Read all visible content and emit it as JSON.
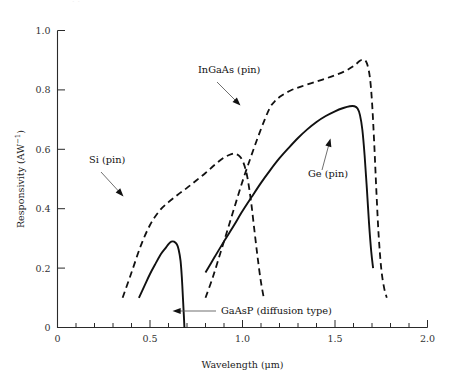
{
  "figure": {
    "ghost_fragment": "··",
    "background": "#ffffff",
    "ink": "#111111"
  },
  "axes": {
    "x": {
      "title": "Wavelength (μm)",
      "min": 0,
      "max": 2.0,
      "major_tick_labels": [
        "0",
        "0.5",
        "1.0",
        "1.5",
        "2.0"
      ],
      "major_tick_values": [
        0,
        0.5,
        1.0,
        1.5,
        2.0
      ],
      "minor_tick_step": 0.1
    },
    "y": {
      "title": "Responsivity (AW",
      "title_sup": "−1",
      "title_tail": ")",
      "min": 0,
      "max": 1.0,
      "major_tick_labels": [
        "0",
        "0.2",
        "0.4",
        "0.6",
        "0.8",
        "1.0"
      ],
      "major_tick_values": [
        0,
        0.2,
        0.4,
        0.6,
        0.8,
        1.0
      ]
    }
  },
  "annotations": [
    {
      "name": "si-pin",
      "text": "Si (pin)",
      "x": 89,
      "y": 163
    },
    {
      "name": "ingaas-pin",
      "text": "InGaAs (pin)",
      "x": 198,
      "y": 73
    },
    {
      "name": "ge-pin",
      "text": "Ge (pin)",
      "x": 308,
      "y": 177
    },
    {
      "name": "gaasp-diffusion",
      "text": "GaAsP (diffusion type)",
      "x": 221,
      "y": 314
    }
  ],
  "chart_data": {
    "type": "line",
    "title": "",
    "xlabel": "Wavelength (μm)",
    "ylabel": "Responsivity (AW-1)",
    "xlim": [
      0,
      2.0
    ],
    "ylim": [
      0,
      1.0
    ],
    "grid": false,
    "legend_position": "inline-annotations",
    "series": [
      {
        "name": "GaAsP (diffusion type)",
        "style": "solid",
        "peak": {
          "x": 0.62,
          "y": 0.29
        },
        "points": [
          [
            0.44,
            0.1
          ],
          [
            0.47,
            0.14
          ],
          [
            0.5,
            0.18
          ],
          [
            0.53,
            0.215
          ],
          [
            0.56,
            0.248
          ],
          [
            0.585,
            0.268
          ],
          [
            0.6,
            0.281
          ],
          [
            0.615,
            0.289
          ],
          [
            0.63,
            0.289
          ],
          [
            0.645,
            0.28
          ],
          [
            0.655,
            0.262
          ],
          [
            0.665,
            0.225
          ],
          [
            0.672,
            0.17
          ],
          [
            0.678,
            0.1
          ],
          [
            0.683,
            0.04
          ],
          [
            0.686,
            0.0
          ]
        ]
      },
      {
        "name": "Si (pin)",
        "style": "dashed",
        "peak": {
          "x": 0.95,
          "y": 0.585
        },
        "points": [
          [
            0.352,
            0.1
          ],
          [
            0.4,
            0.185
          ],
          [
            0.45,
            0.275
          ],
          [
            0.5,
            0.345
          ],
          [
            0.55,
            0.392
          ],
          [
            0.6,
            0.422
          ],
          [
            0.65,
            0.447
          ],
          [
            0.7,
            0.47
          ],
          [
            0.75,
            0.495
          ],
          [
            0.8,
            0.52
          ],
          [
            0.85,
            0.548
          ],
          [
            0.9,
            0.572
          ],
          [
            0.94,
            0.584
          ],
          [
            0.96,
            0.585
          ],
          [
            0.985,
            0.576
          ],
          [
            1.005,
            0.555
          ],
          [
            1.025,
            0.51
          ],
          [
            1.045,
            0.43
          ],
          [
            1.062,
            0.34
          ],
          [
            1.08,
            0.245
          ],
          [
            1.098,
            0.16
          ],
          [
            1.115,
            0.1
          ]
        ]
      },
      {
        "name": "InGaAs (pin)",
        "style": "dashed",
        "peak": {
          "x": 1.65,
          "y": 0.902
        },
        "points": [
          [
            0.8,
            0.1
          ],
          [
            0.84,
            0.17
          ],
          [
            0.88,
            0.25
          ],
          [
            0.92,
            0.33
          ],
          [
            0.96,
            0.412
          ],
          [
            1.0,
            0.492
          ],
          [
            1.04,
            0.565
          ],
          [
            1.08,
            0.635
          ],
          [
            1.12,
            0.7
          ],
          [
            1.15,
            0.742
          ],
          [
            1.175,
            0.762
          ],
          [
            1.21,
            0.78
          ],
          [
            1.26,
            0.798
          ],
          [
            1.32,
            0.812
          ],
          [
            1.4,
            0.828
          ],
          [
            1.48,
            0.845
          ],
          [
            1.55,
            0.862
          ],
          [
            1.6,
            0.88
          ],
          [
            1.635,
            0.898
          ],
          [
            1.655,
            0.902
          ],
          [
            1.672,
            0.89
          ],
          [
            1.688,
            0.845
          ],
          [
            1.7,
            0.76
          ],
          [
            1.712,
            0.62
          ],
          [
            1.724,
            0.455
          ],
          [
            1.736,
            0.31
          ],
          [
            1.75,
            0.198
          ],
          [
            1.765,
            0.135
          ],
          [
            1.78,
            0.1
          ]
        ]
      },
      {
        "name": "Ge (pin)",
        "style": "solid",
        "peak": {
          "x": 1.6,
          "y": 0.745
        },
        "points": [
          [
            0.8,
            0.185
          ],
          [
            0.85,
            0.238
          ],
          [
            0.9,
            0.29
          ],
          [
            0.95,
            0.34
          ],
          [
            1.0,
            0.392
          ],
          [
            1.05,
            0.44
          ],
          [
            1.1,
            0.487
          ],
          [
            1.15,
            0.53
          ],
          [
            1.2,
            0.57
          ],
          [
            1.25,
            0.605
          ],
          [
            1.3,
            0.638
          ],
          [
            1.35,
            0.667
          ],
          [
            1.4,
            0.692
          ],
          [
            1.45,
            0.712
          ],
          [
            1.5,
            0.728
          ],
          [
            1.545,
            0.739
          ],
          [
            1.58,
            0.745
          ],
          [
            1.605,
            0.745
          ],
          [
            1.622,
            0.737
          ],
          [
            1.635,
            0.715
          ],
          [
            1.648,
            0.665
          ],
          [
            1.66,
            0.58
          ],
          [
            1.672,
            0.47
          ],
          [
            1.684,
            0.35
          ],
          [
            1.696,
            0.255
          ],
          [
            1.706,
            0.2
          ]
        ]
      }
    ]
  }
}
